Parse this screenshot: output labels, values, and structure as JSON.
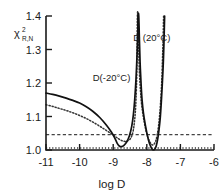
{
  "chart_data": {
    "type": "line",
    "title": "",
    "xlabel": "log D",
    "ylabel": "chi-squared R,N",
    "ylabel_parts": {
      "base": "χ",
      "sup": "2",
      "sub": "R,N"
    },
    "xlim": [
      -11,
      -6
    ],
    "ylim": [
      1.0,
      1.4
    ],
    "xticks": [
      -11,
      -10,
      -9,
      -8,
      -7,
      -6
    ],
    "xtick_labels": [
      "-11",
      "-10",
      "-9",
      "-8",
      "-7",
      "-6"
    ],
    "yticks": [
      1.0,
      1.1,
      1.2,
      1.3,
      1.4
    ],
    "ytick_labels": [
      "1.0",
      "1.1",
      "1.2",
      "1.3",
      "1.4"
    ],
    "grid": false,
    "legend_position": "inline-annotations",
    "annotations": [
      {
        "text": "D(-20°C)",
        "x": -9.05,
        "y": 1.205,
        "style": "dotted-curve-label"
      },
      {
        "text": "D (20°C)",
        "x": -7.85,
        "y": 1.325,
        "style": "solid-curve-label"
      }
    ],
    "series": [
      {
        "name": "D (20°C)",
        "style": "solid",
        "comment": "solid curve: broad minimum near -8.85, vertical asymptote near -8.25, sharp second minimum near -7.80, steep rise near -7.50",
        "points": [
          [
            -11.0,
            1.17
          ],
          [
            -10.8,
            1.166
          ],
          [
            -10.6,
            1.161
          ],
          [
            -10.4,
            1.155
          ],
          [
            -10.2,
            1.148
          ],
          [
            -10.0,
            1.14
          ],
          [
            -9.8,
            1.129
          ],
          [
            -9.6,
            1.115
          ],
          [
            -9.4,
            1.097
          ],
          [
            -9.2,
            1.074
          ],
          [
            -9.05,
            1.053
          ],
          [
            -8.95,
            1.035
          ],
          [
            -8.88,
            1.02
          ],
          [
            -8.82,
            1.012
          ],
          [
            -8.75,
            1.01
          ],
          [
            -8.68,
            1.014
          ],
          [
            -8.6,
            1.024
          ],
          [
            -8.52,
            1.042
          ],
          [
            -8.45,
            1.07
          ],
          [
            -8.4,
            1.105
          ],
          [
            -8.36,
            1.15
          ],
          [
            -8.32,
            1.215
          ],
          [
            -8.29,
            1.285
          ],
          [
            -8.27,
            1.34
          ],
          [
            -8.26,
            1.4
          ],
          [
            -8.24,
            1.4
          ],
          [
            -8.22,
            1.33
          ],
          [
            -8.2,
            1.262
          ],
          [
            -8.17,
            1.196
          ],
          [
            -8.14,
            1.148
          ],
          [
            -8.1,
            1.11
          ],
          [
            -8.05,
            1.078
          ],
          [
            -8.0,
            1.052
          ],
          [
            -7.95,
            1.03
          ],
          [
            -7.9,
            1.014
          ],
          [
            -7.85,
            1.004
          ],
          [
            -7.8,
            1.0
          ],
          [
            -7.76,
            1.003
          ],
          [
            -7.72,
            1.012
          ],
          [
            -7.68,
            1.03
          ],
          [
            -7.64,
            1.058
          ],
          [
            -7.6,
            1.096
          ],
          [
            -7.57,
            1.14
          ],
          [
            -7.54,
            1.195
          ],
          [
            -7.51,
            1.258
          ],
          [
            -7.49,
            1.32
          ],
          [
            -7.47,
            1.4
          ]
        ]
      },
      {
        "name": "D(-20°C)",
        "style": "dotted",
        "comment": "dotted curve: starts lower at left, minimum near -8.70, asymptote near -8.28, second minimum near -7.95, rise near -7.55",
        "points": [
          [
            -11.0,
            1.135
          ],
          [
            -10.8,
            1.13
          ],
          [
            -10.6,
            1.124
          ],
          [
            -10.4,
            1.118
          ],
          [
            -10.2,
            1.111
          ],
          [
            -10.0,
            1.103
          ],
          [
            -9.8,
            1.094
          ],
          [
            -9.6,
            1.083
          ],
          [
            -9.4,
            1.071
          ],
          [
            -9.2,
            1.058
          ],
          [
            -9.0,
            1.045
          ],
          [
            -8.85,
            1.034
          ],
          [
            -8.72,
            1.027
          ],
          [
            -8.6,
            1.026
          ],
          [
            -8.5,
            1.032
          ],
          [
            -8.44,
            1.044
          ],
          [
            -8.4,
            1.06
          ],
          [
            -8.37,
            1.082
          ],
          [
            -8.34,
            1.115
          ],
          [
            -8.32,
            1.155
          ],
          [
            -8.3,
            1.215
          ],
          [
            -8.29,
            1.29
          ],
          [
            -8.28,
            1.4
          ],
          [
            -8.26,
            1.4
          ],
          [
            -8.24,
            1.3
          ],
          [
            -8.22,
            1.232
          ],
          [
            -8.19,
            1.18
          ],
          [
            -8.16,
            1.142
          ],
          [
            -8.12,
            1.11
          ],
          [
            -8.07,
            1.08
          ],
          [
            -8.02,
            1.056
          ],
          [
            -7.97,
            1.038
          ],
          [
            -7.92,
            1.026
          ],
          [
            -7.87,
            1.018
          ],
          [
            -7.82,
            1.015
          ],
          [
            -7.78,
            1.018
          ],
          [
            -7.73,
            1.028
          ],
          [
            -7.69,
            1.046
          ],
          [
            -7.65,
            1.072
          ],
          [
            -7.62,
            1.102
          ],
          [
            -7.59,
            1.142
          ],
          [
            -7.56,
            1.195
          ],
          [
            -7.54,
            1.25
          ],
          [
            -7.52,
            1.315
          ],
          [
            -7.5,
            1.4
          ]
        ]
      }
    ],
    "reference_lines": [
      {
        "name": "confidence-level-dashed",
        "style": "dashed",
        "y": 1.046,
        "x_start": -11.0,
        "x_end": -6.0
      },
      {
        "name": "baseline-dotted",
        "style": "dotted",
        "y": 1.006,
        "x_start": -11.0,
        "x_end": -6.0
      }
    ]
  }
}
